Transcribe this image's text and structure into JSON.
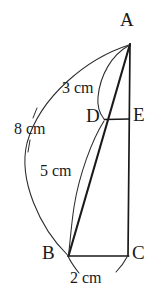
{
  "figure": {
    "background_color": "#ffffff",
    "stroke_color": "#1a1a1a",
    "vertices": [
      {
        "id": "A",
        "label": "A",
        "x": 130,
        "y": 42,
        "label_x": 120,
        "label_y": 10
      },
      {
        "id": "B",
        "label": "B",
        "x": 68,
        "y": 256,
        "label_x": 42,
        "label_y": 243
      },
      {
        "id": "C",
        "label": "C",
        "x": 128,
        "y": 256,
        "label_x": 132,
        "label_y": 243
      },
      {
        "id": "D",
        "label": "D",
        "x": 105,
        "y": 120,
        "label_x": 86,
        "label_y": 106
      },
      {
        "id": "E",
        "label": "E",
        "x": 129,
        "y": 119,
        "label_x": 133,
        "label_y": 105
      }
    ],
    "segments": [
      {
        "name": "segment-a-c",
        "from": "A",
        "to": "C",
        "width": 1.6
      },
      {
        "name": "segment-b-c",
        "from": "B",
        "to": "C",
        "width": 1.6
      },
      {
        "name": "segment-a-b-through-d",
        "from": "A",
        "to": "B",
        "width": 2.0
      },
      {
        "name": "segment-d-e",
        "from": "D",
        "to": "E",
        "width": 1.4
      }
    ],
    "arcs": [
      {
        "name": "arc-8cm-a-to-b",
        "measure": "8 cm"
      },
      {
        "name": "arc-3cm-a-to-d",
        "measure": "3 cm"
      },
      {
        "name": "arc-5cm-d-to-b",
        "measure": "5 cm"
      },
      {
        "name": "arc-2cm-b-to-c",
        "measure": "2 cm"
      }
    ],
    "measurements": [
      {
        "id": "m3",
        "label": "3 cm",
        "x": 62,
        "y": 80,
        "describes": "A to D"
      },
      {
        "id": "m8",
        "label": "8 cm",
        "x": 14,
        "y": 121,
        "describes": "A to B"
      },
      {
        "id": "m5",
        "label": "5 cm",
        "x": 40,
        "y": 163,
        "describes": "D to B"
      },
      {
        "id": "m2",
        "label": "2 cm",
        "x": 70,
        "y": 270,
        "describes": "B to C"
      }
    ]
  }
}
